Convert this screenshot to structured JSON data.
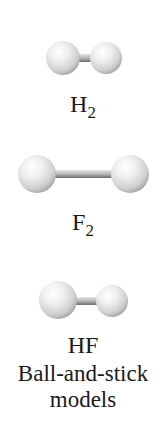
{
  "figure": {
    "title": "Ball-and-stick models",
    "caption_line1": "Ball-and-stick",
    "caption_line2": "models",
    "molecules": [
      {
        "name": "H2",
        "formula_base": "H",
        "formula_sub": "2",
        "atoms": [
          "H",
          "H"
        ]
      },
      {
        "name": "F2",
        "formula_base": "F",
        "formula_sub": "2",
        "atoms": [
          "F",
          "F"
        ]
      },
      {
        "name": "HF",
        "formula_base": "HF",
        "formula_sub": "",
        "atoms": [
          "H",
          "F"
        ]
      }
    ]
  },
  "colors": {
    "sphere_highlight": "#ffffff",
    "sphere_mid": "#dcdcdc",
    "sphere_shadow": "#9a9a9a",
    "stick_light": "#d8d8d8",
    "stick_dark": "#7a7a7a",
    "text": "#1a1a1a",
    "background": "#ffffff"
  }
}
